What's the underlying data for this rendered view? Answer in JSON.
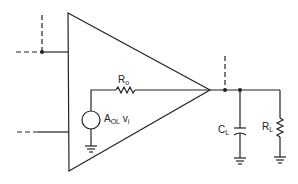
{
  "diagram": {
    "type": "circuit",
    "components": {
      "amplifier": {
        "name": "op-amp triangle"
      },
      "output_resistor": {
        "symbol": "R",
        "subscript": "o"
      },
      "gain_source": {
        "symbol": "A",
        "subscript": "OL",
        "suffix": "v",
        "suffix_sub": "i"
      },
      "load_capacitor": {
        "symbol": "C",
        "subscript": "L"
      },
      "load_resistor": {
        "symbol": "R",
        "subscript": "L"
      }
    },
    "colors": {
      "line": "#222222",
      "background": "#ffffff"
    }
  }
}
